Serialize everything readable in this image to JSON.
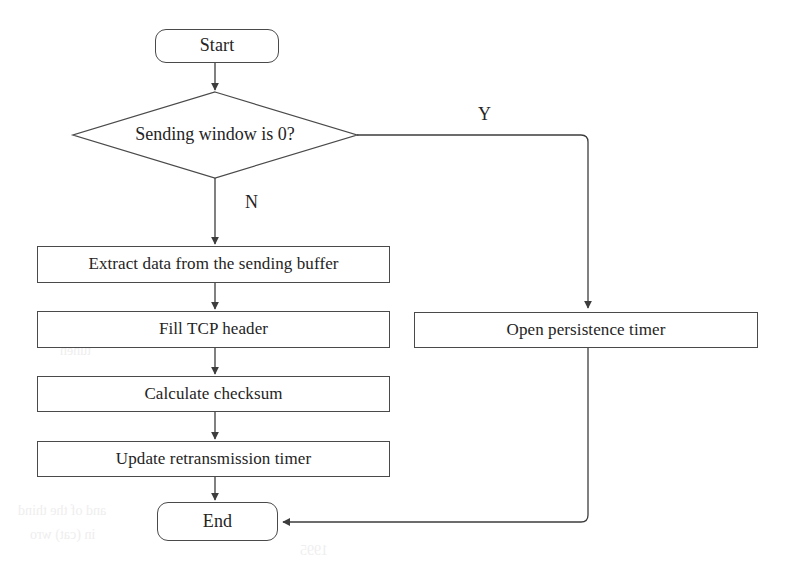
{
  "diagram": {
    "type": "flowchart",
    "background_color": "#ffffff",
    "line_color": "#4a4a4a",
    "text_color": "#242424",
    "nodes": [
      {
        "id": "start",
        "label": "Start",
        "shape": "terminator"
      },
      {
        "id": "decision",
        "label": "Sending window is 0?",
        "shape": "diamond"
      },
      {
        "id": "extract",
        "label": "Extract data from the sending buffer",
        "shape": "process"
      },
      {
        "id": "fill",
        "label": "Fill TCP header",
        "shape": "process"
      },
      {
        "id": "checksum",
        "label": "Calculate checksum",
        "shape": "process"
      },
      {
        "id": "retransmit",
        "label": "Update retransmission timer",
        "shape": "process"
      },
      {
        "id": "persist",
        "label": "Open persistence timer",
        "shape": "process"
      },
      {
        "id": "end",
        "label": "End",
        "shape": "terminator"
      }
    ],
    "edge_labels": {
      "yes": "Y",
      "no": "N"
    },
    "ghost_text": {
      "line1": "and of the thind",
      "line2": "in (cat) wro",
      "line3": "1995",
      "line4": "tuhen"
    }
  }
}
